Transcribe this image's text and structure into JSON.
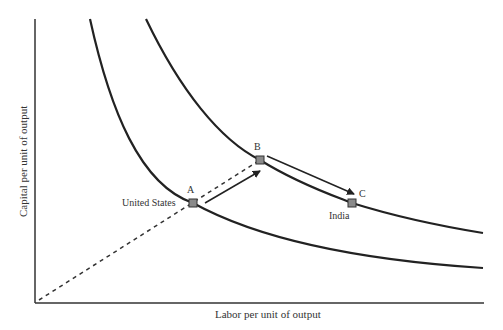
{
  "diagram": {
    "title": "",
    "x_axis_label": "Labor per unit of output",
    "y_axis_label": "Capital per unit of output",
    "points": [
      {
        "id": "A",
        "label": "A",
        "country_label": "United States"
      },
      {
        "id": "B",
        "label": "B",
        "country_label": ""
      },
      {
        "id": "C",
        "label": "C",
        "country_label": "India"
      }
    ],
    "curves": [
      {
        "name": "inner-isoquant"
      },
      {
        "name": "outer-isoquant"
      }
    ],
    "colors": {
      "line": "#222222",
      "marker": "#8a8a8a",
      "text": "#333333"
    }
  }
}
